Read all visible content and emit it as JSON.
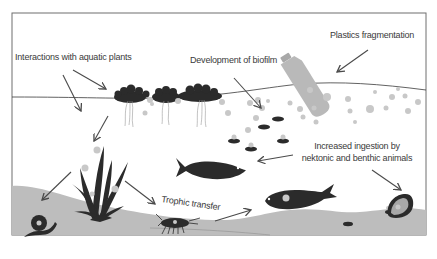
{
  "labels": {
    "aquatic_plants": "Interactions with aquatic plants",
    "biofilm": "Development of biofilm",
    "plastics": "Plastics fragmentation",
    "ingestion_line1": "Increased ingestion by",
    "ingestion_line2": "nektonic and benthic animals",
    "trophic": "Trophic transfer"
  },
  "colors": {
    "frame": "#6e6e6e",
    "sediment": "#bdbdbd",
    "organism": "#2b2b2b",
    "particle": "#c8c8c8",
    "bottle": "#b9b9b9",
    "arrow": "#4a4a4a"
  }
}
